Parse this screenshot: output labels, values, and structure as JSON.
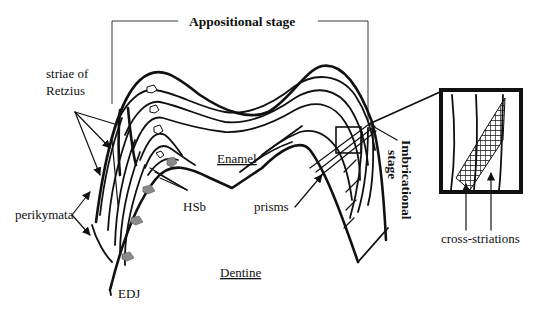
{
  "labels": {
    "appositional_stage": "Appositional stage",
    "imbricational_stage_line1": "Imbricational",
    "imbricational_stage_line2": "stage",
    "striae_line1": "striae of",
    "striae_line2": "Retzius",
    "enamel": "Enamel",
    "dentine": "Dentine",
    "perikymata": "perikymata",
    "hsb": "HSb",
    "prisms": "prisms",
    "edj": "EDJ",
    "cross_striations": "cross-striations"
  },
  "colors": {
    "ink": "#111111",
    "hsb_fill": "#8a8a8a",
    "background": "#ffffff"
  },
  "inset": {
    "description": "magnified box showing prisms with cross-striations",
    "pointer_arrows": 2
  }
}
